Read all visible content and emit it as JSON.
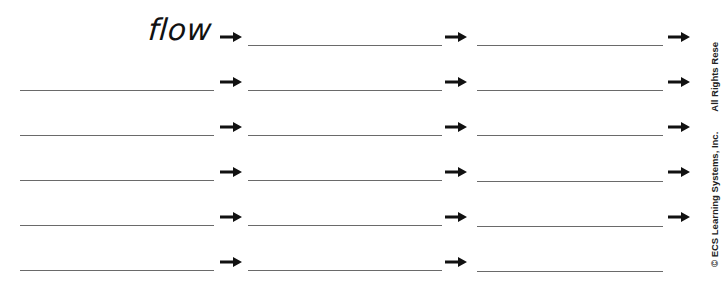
{
  "worksheet": {
    "start_word": "flow",
    "rows": [
      {
        "has_start_blank": false,
        "has_end_arrow": true
      },
      {
        "has_start_blank": true,
        "has_end_arrow": true
      },
      {
        "has_start_blank": true,
        "has_end_arrow": true
      },
      {
        "has_start_blank": true,
        "has_end_arrow": true
      },
      {
        "has_start_blank": true,
        "has_end_arrow": true
      },
      {
        "has_start_blank": true,
        "has_end_arrow": false
      }
    ],
    "icons": {
      "arrow": "right-arrow-icon"
    },
    "colors": {
      "line": "#6a6a6a",
      "arrow": "#111111",
      "text": "#111111"
    }
  },
  "footer": {
    "copyright": "© ECS Learning Systems, Inc.",
    "rights": "All Rights Rese"
  }
}
